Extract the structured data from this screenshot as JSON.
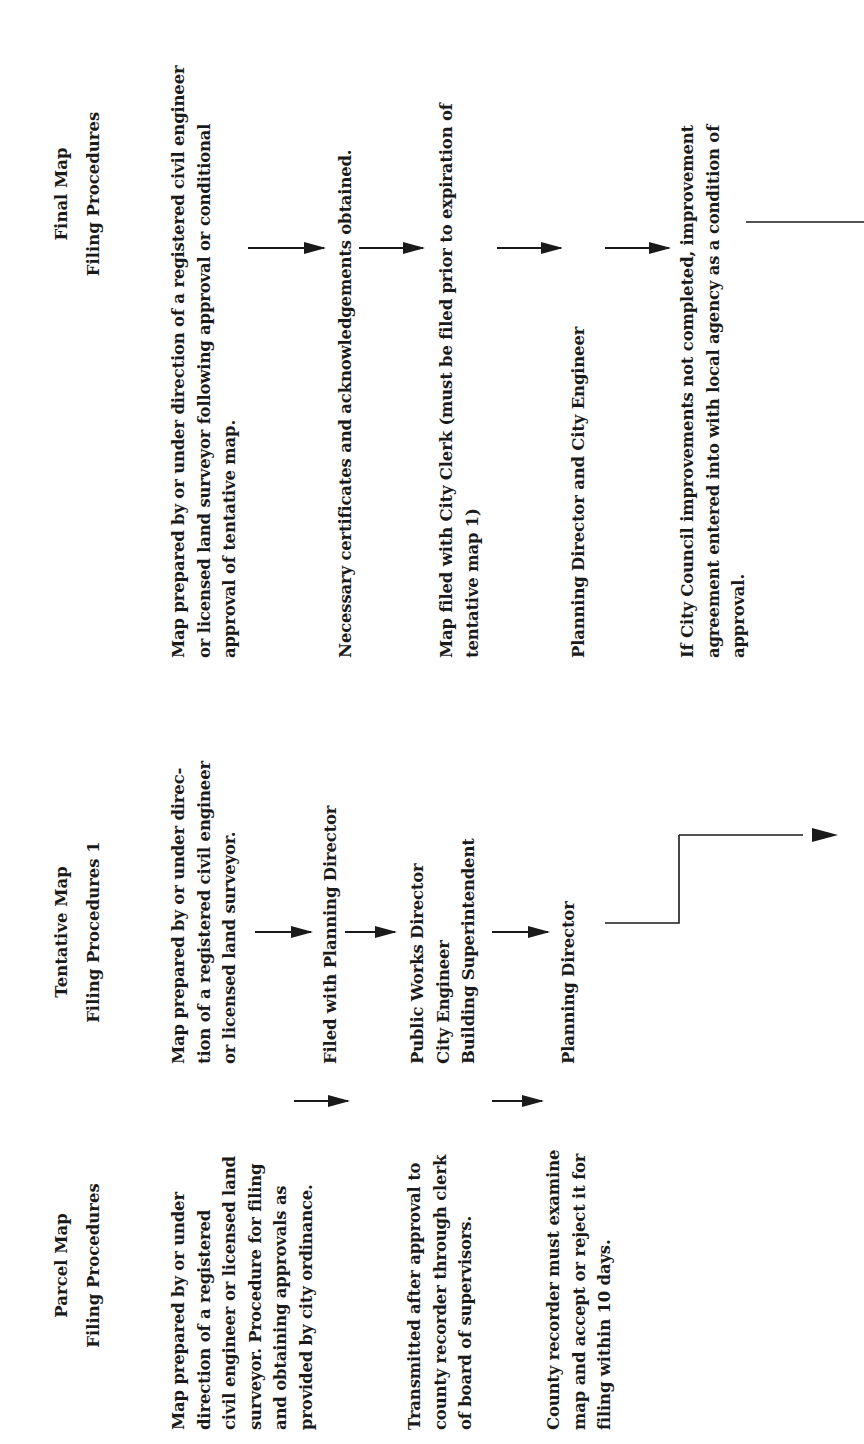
{
  "columns": [
    {
      "id": "parcel",
      "title": "Parcel Map",
      "subtitle": "Filing Procedures",
      "steps": [
        "Map prepared by or under\ndirection of a registered\ncivil engineer or licensed land\nsurveyor.  Procedure for filing\nand obtaining approvals as\nprovided by city ordinance.",
        "Transmitted after approval to\ncounty recorder through clerk\nof board of supervisors.",
        "County recorder must examine\nmap and accept or reject it for\nfiling within 10 days."
      ]
    },
    {
      "id": "tentative",
      "title": "Tentative Map",
      "subtitle": "Filing Procedures 1",
      "steps": [
        "Map prepared by or under direc-\ntion of a registered civil engineer\nor licensed land surveyor.",
        "Filed with Planning Director",
        "Public Works Director\nCity  Engineer\nBuilding Superintendent",
        "Planning Director"
      ]
    },
    {
      "id": "final",
      "title": "Final Map",
      "subtitle": "Filing Procedures",
      "steps": [
        "Map prepared by or under direction of a registered civil engineer\nor licensed land surveyor following approval or conditional\napproval of tentative map.",
        "Necessary certificates and acknowledgements obtained.",
        "Map filed with City Clerk (must be filed prior to expiration of\ntentative map 1)",
        "Planning Director and City Engineer",
        "If City Council improvements not completed, improvement\nagreement entered into with local agency as a condition of\napproval."
      ]
    }
  ],
  "colors": {
    "ink": "#1a1a1a",
    "paper": "#ffffff"
  },
  "orientation": "rotated-90-ccw"
}
